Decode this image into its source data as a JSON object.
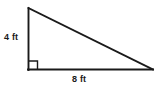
{
  "figure": {
    "kind": "right-triangle-diagram",
    "shape_name": "right triangle",
    "background_color": "#ffffff",
    "stroke_color": "#1a1a1a",
    "canvas": {
      "width": 159,
      "height": 89
    },
    "vertices": {
      "apex_top": {
        "x": 28,
        "y": 8
      },
      "right_angle_corner": {
        "x": 28,
        "y": 70
      },
      "vertex_right": {
        "x": 153,
        "y": 70
      }
    },
    "right_angle": {
      "at": "bottom-left",
      "marker": "square",
      "marker_size_px": 8
    },
    "labels": {
      "vertical_leg": "4 ft",
      "horizontal_leg": "8 ft"
    },
    "measurements": [
      {
        "side": "vertical leg",
        "value": 4,
        "unit": "ft",
        "label": "4 ft"
      },
      {
        "side": "horizontal leg",
        "value": 8,
        "unit": "ft",
        "label": "8 ft"
      }
    ]
  }
}
